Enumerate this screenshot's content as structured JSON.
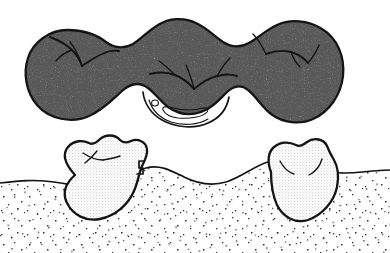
{
  "figure": {
    "caption": "",
    "domain": "dental-illustration",
    "style": "ink line drawing with stipple shading",
    "canvas": {
      "width": 390,
      "height": 253,
      "background": "#ffffff"
    }
  },
  "colors": {
    "ink": "#141414",
    "background": "#ffffff",
    "bridge_stipple": "#8c8c8c",
    "tooth_stipple": "#ededed",
    "gum_dot": "#3a3a3a"
  },
  "panels": [
    {
      "id": "upper-panel",
      "name": "bridge-prosthesis",
      "label": "Three-unit fixed bridge, occlusal/buccal view",
      "fill_tone": "dense stipple",
      "units": [
        {
          "name": "retainer-crown-left",
          "position": "left",
          "label": "Left retainer crown"
        },
        {
          "name": "pontic-center",
          "position": "center",
          "label": "Pontic"
        },
        {
          "name": "retainer-crown-right",
          "position": "right",
          "label": "Right retainer crown"
        }
      ],
      "details": [
        {
          "name": "occlusal-groove-left",
          "label": "Occlusal fissure pattern, left unit"
        },
        {
          "name": "occlusal-groove-center",
          "label": "Occlusal fissure pattern, pontic"
        },
        {
          "name": "occlusal-groove-right",
          "label": "Occlusal fissure pattern, right unit"
        },
        {
          "name": "connector-saddle",
          "label": "Pontic undersurface saddle"
        },
        {
          "name": "retention-hole",
          "label": "Round retention perforation"
        },
        {
          "name": "retention-slot",
          "label": "Elongated retention slot"
        }
      ]
    },
    {
      "id": "lower-panel",
      "name": "abutment-teeth-and-ridge",
      "label": "Prepared abutment teeth with edentulous ridge",
      "fill_tone": "light stipple",
      "units": [
        {
          "name": "abutment-tooth-left",
          "position": "left",
          "label": "Left prepared abutment tooth"
        },
        {
          "name": "abutment-tooth-right",
          "position": "right",
          "label": "Right prepared abutment tooth"
        }
      ],
      "details": [
        {
          "name": "preparation-margin-step",
          "label": "Shoulder preparation margin, left abutment"
        },
        {
          "name": "occlusal-fissure-left",
          "label": "Occlusal fissure marking, left abutment"
        },
        {
          "name": "occlusal-fissure-right",
          "label": "Occlusal fissure markings, right abutment"
        },
        {
          "name": "gingival-ridge-contour",
          "label": "Edentulous gingival ridge contour"
        },
        {
          "name": "gingival-stipple-field",
          "label": "Stippled gingival tissue"
        }
      ]
    }
  ]
}
